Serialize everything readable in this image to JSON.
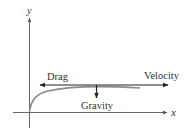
{
  "diagram": {
    "axes": {
      "x_label": "x",
      "y_label": "y"
    },
    "forces": {
      "drag_label": "Drag",
      "velocity_label": "Velocity",
      "gravity_label": "Gravity"
    },
    "colors": {
      "axis": "#555555",
      "arrow": "#222222",
      "curve": "#888888",
      "text": "#333333"
    }
  }
}
